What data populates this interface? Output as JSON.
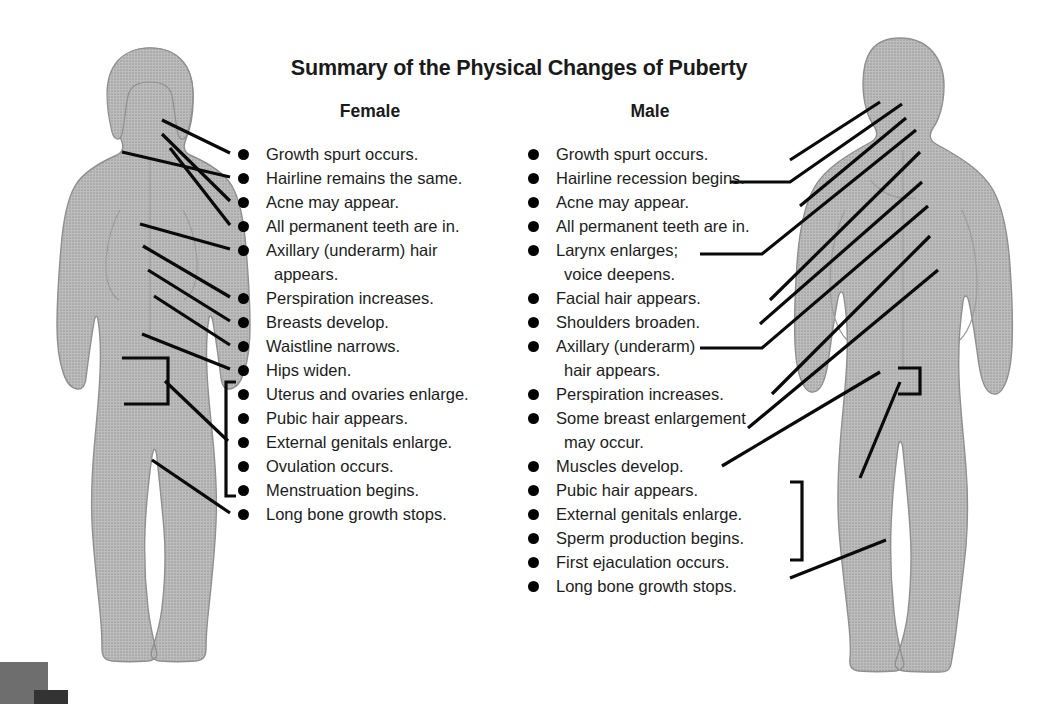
{
  "title": "Summary of the Physical Changes of Puberty",
  "columns": {
    "female": {
      "heading": "Female",
      "items": [
        {
          "text": "Growth spurt occurs.",
          "bullet": true
        },
        {
          "text": "Hairline remains the same.",
          "bullet": true
        },
        {
          "text": "Acne may appear.",
          "bullet": true
        },
        {
          "text": "All permanent teeth are in.",
          "bullet": true
        },
        {
          "text": "Axillary (underarm) hair",
          "bullet": true
        },
        {
          "text": "appears.",
          "bullet": false
        },
        {
          "text": "Perspiration increases.",
          "bullet": true
        },
        {
          "text": "Breasts develop.",
          "bullet": true
        },
        {
          "text": "Waistline narrows.",
          "bullet": true
        },
        {
          "text": "Hips widen.",
          "bullet": true
        },
        {
          "text": "Uterus and ovaries enlarge.",
          "bullet": true
        },
        {
          "text": "Pubic hair appears.",
          "bullet": true
        },
        {
          "text": "External genitals enlarge.",
          "bullet": true
        },
        {
          "text": "Ovulation occurs.",
          "bullet": true
        },
        {
          "text": "Menstruation begins.",
          "bullet": true
        },
        {
          "text": "Long bone growth stops.",
          "bullet": true
        }
      ]
    },
    "male": {
      "heading": "Male",
      "items": [
        {
          "text": "Growth spurt occurs.",
          "bullet": true
        },
        {
          "text": "Hairline recession begins.",
          "bullet": true
        },
        {
          "text": "Acne may appear.",
          "bullet": true
        },
        {
          "text": "All permanent teeth are in.",
          "bullet": true
        },
        {
          "text": "Larynx enlarges;",
          "bullet": true
        },
        {
          "text": "voice deepens.",
          "bullet": false
        },
        {
          "text": "Facial hair appears.",
          "bullet": true
        },
        {
          "text": "Shoulders broaden.",
          "bullet": true
        },
        {
          "text": "Axillary (underarm)",
          "bullet": true
        },
        {
          "text": "hair appears.",
          "bullet": false
        },
        {
          "text": "Perspiration increases.",
          "bullet": true
        },
        {
          "text": "Some breast enlargement",
          "bullet": true
        },
        {
          "text": "may occur.",
          "bullet": false
        },
        {
          "text": "Muscles develop.",
          "bullet": true
        },
        {
          "text": "Pubic hair appears.",
          "bullet": true
        },
        {
          "text": "External genitals enlarge.",
          "bullet": true
        },
        {
          "text": "Sperm production begins.",
          "bullet": true
        },
        {
          "text": "First ejaculation occurs.",
          "bullet": true
        },
        {
          "text": "Long bone growth stops.",
          "bullet": true
        }
      ]
    }
  },
  "figures": {
    "female_label": "female-body-silhouette",
    "male_label": "male-body-silhouette"
  },
  "colors": {
    "body_fill": "#b0b0b0",
    "body_stroke": "#8d8d8d",
    "line": "#0a0a0a",
    "text": "#1c1c1c",
    "background": "#ffffff",
    "corner_gray": "#6e6e6e",
    "corner_dark": "#333333"
  }
}
